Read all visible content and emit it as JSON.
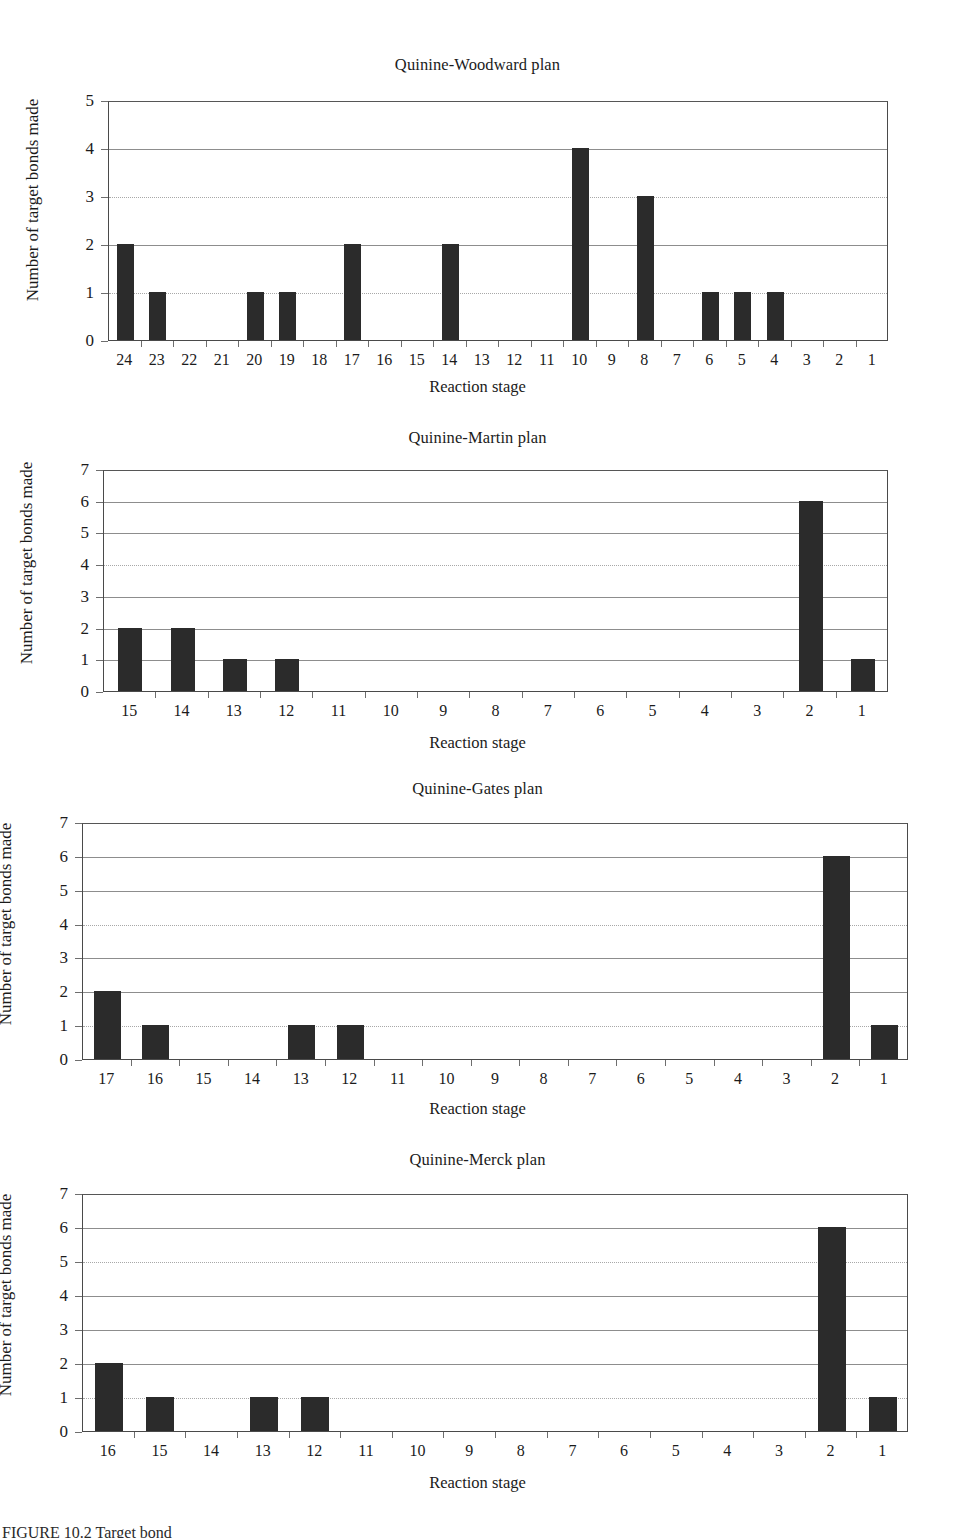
{
  "figure": {
    "shared_xlabel": "Reaction stage",
    "shared_ylabel": "Number of target bonds made",
    "bar_color": "#2b2b2b",
    "axis_color": "#4a4a4a",
    "grid_color": "#8d8d8d",
    "background": "#ffffff",
    "caption": "FIGURE 10.2  Target bond"
  },
  "chart_data": [
    {
      "type": "bar",
      "title": "Quinine-Woodward plan",
      "xlabel": "Reaction stage",
      "ylabel": "Number of target bonds made",
      "categories": [
        "24",
        "23",
        "22",
        "21",
        "20",
        "19",
        "18",
        "17",
        "16",
        "15",
        "14",
        "13",
        "12",
        "11",
        "10",
        "9",
        "8",
        "7",
        "6",
        "5",
        "4",
        "3",
        "2",
        "1"
      ],
      "values": [
        2,
        1,
        0,
        0,
        1,
        1,
        0,
        2,
        0,
        0,
        2,
        0,
        0,
        0,
        4,
        0,
        3,
        0,
        1,
        1,
        1,
        0,
        0,
        0
      ],
      "ylim": [
        0,
        5
      ],
      "yticks": [
        0,
        1,
        2,
        3,
        4,
        5
      ],
      "grid": true,
      "legend": "none"
    },
    {
      "type": "bar",
      "title": "Quinine-Martin plan",
      "xlabel": "Reaction stage",
      "ylabel": "Number of target bonds made",
      "categories": [
        "15",
        "14",
        "13",
        "12",
        "11",
        "10",
        "9",
        "8",
        "7",
        "6",
        "5",
        "4",
        "3",
        "2",
        "1"
      ],
      "values": [
        2,
        2,
        1,
        1,
        0,
        0,
        0,
        0,
        0,
        0,
        0,
        0,
        0,
        6,
        1
      ],
      "ylim": [
        0,
        7
      ],
      "yticks": [
        0,
        1,
        2,
        3,
        4,
        5,
        6,
        7
      ],
      "grid": true,
      "legend": "none"
    },
    {
      "type": "bar",
      "title": "Quinine-Gates plan",
      "xlabel": "Reaction stage",
      "ylabel": "Number of target bonds made",
      "categories": [
        "17",
        "16",
        "15",
        "14",
        "13",
        "12",
        "11",
        "10",
        "9",
        "8",
        "7",
        "6",
        "5",
        "4",
        "3",
        "2",
        "1"
      ],
      "values": [
        2,
        1,
        0,
        0,
        1,
        1,
        0,
        0,
        0,
        0,
        0,
        0,
        0,
        0,
        0,
        6,
        1
      ],
      "ylim": [
        0,
        7
      ],
      "yticks": [
        0,
        1,
        2,
        3,
        4,
        5,
        6,
        7
      ],
      "grid": true,
      "legend": "none"
    },
    {
      "type": "bar",
      "title": "Quinine-Merck plan",
      "xlabel": "Reaction stage",
      "ylabel": "Number of target bonds made",
      "categories": [
        "16",
        "15",
        "14",
        "13",
        "12",
        "11",
        "10",
        "9",
        "8",
        "7",
        "6",
        "5",
        "4",
        "3",
        "2",
        "1"
      ],
      "values": [
        2,
        1,
        0,
        1,
        1,
        0,
        0,
        0,
        0,
        0,
        0,
        0,
        0,
        0,
        6,
        1
      ],
      "ylim": [
        0,
        7
      ],
      "yticks": [
        0,
        1,
        2,
        3,
        4,
        5,
        6,
        7
      ],
      "grid": true,
      "legend": "none"
    }
  ]
}
